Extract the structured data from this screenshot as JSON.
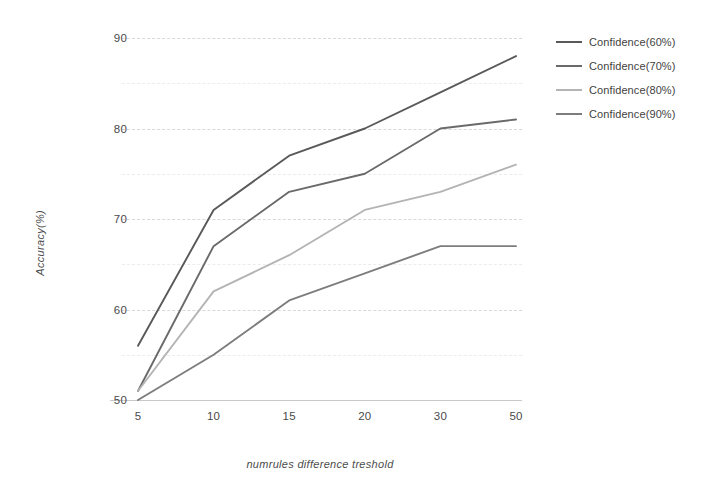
{
  "chart_data": {
    "type": "line",
    "title": "",
    "xlabel": "numrules difference treshold",
    "ylabel": "Accuracy(%)",
    "categories": [
      "5",
      "10",
      "15",
      "20",
      "30",
      "50"
    ],
    "ylim": [
      50,
      90
    ],
    "yticks": [
      50,
      60,
      70,
      80,
      90
    ],
    "grid": true,
    "legend_position": "right",
    "series": [
      {
        "name": "Confidence(60%)",
        "color": "#595959",
        "values": [
          56,
          71,
          77,
          80,
          84,
          88
        ]
      },
      {
        "name": "Confidence(70%)",
        "color": "#6a6a6a",
        "values": [
          51,
          67,
          73,
          75,
          80,
          81
        ]
      },
      {
        "name": "Confidence(80%)",
        "color": "#b4b4b4",
        "values": [
          51,
          62,
          66,
          71,
          73,
          76
        ]
      },
      {
        "name": "Confidence(90%)",
        "color": "#7d7d7d",
        "values": [
          50,
          55,
          61,
          64,
          67,
          67
        ]
      }
    ]
  },
  "axes": {
    "y_tick_labels": [
      "90",
      "80",
      "70",
      "60",
      "50"
    ],
    "x_tick_labels": [
      "5",
      "10",
      "15",
      "20",
      "30",
      "50"
    ],
    "y_title": "Accuracy(%)",
    "x_title": "numrules difference treshold"
  },
  "legend": {
    "items": [
      {
        "label": "Confidence(60%)",
        "color": "#595959"
      },
      {
        "label": "Confidence(70%)",
        "color": "#6a6a6a"
      },
      {
        "label": "Confidence(80%)",
        "color": "#b4b4b4"
      },
      {
        "label": "Confidence(90%)",
        "color": "#7d7d7d"
      }
    ]
  }
}
